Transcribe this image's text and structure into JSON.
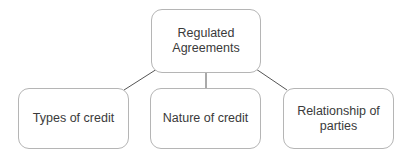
{
  "diagram": {
    "type": "hierarchy",
    "root": {
      "label": "Regulated Agreements"
    },
    "children": [
      {
        "label": "Types of credit"
      },
      {
        "label": "Nature of credit"
      },
      {
        "label": "Relationship of parties"
      }
    ],
    "colors": {
      "border": "#b5b5b5",
      "connector": "#555555",
      "text": "#3a3a3a",
      "background": "#ffffff"
    }
  }
}
